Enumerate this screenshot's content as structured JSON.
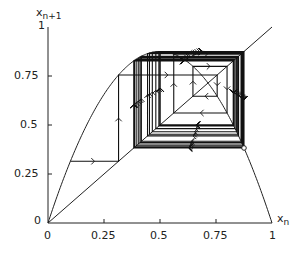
{
  "chart_data": {
    "type": "line",
    "title": "",
    "xlabel": "x_n",
    "ylabel": "x_{n+1}",
    "xlim": [
      0,
      1
    ],
    "ylim": [
      0,
      1
    ],
    "grid": false,
    "x_ticks": [
      "0",
      "0.25",
      "0.5",
      "0.75",
      "1"
    ],
    "y_ticks": [
      "0",
      "0.25",
      "0.5",
      "0.75",
      "1"
    ],
    "series": [
      {
        "name": "map curve",
        "function": "r*x*(1-x)",
        "r": 3.5
      },
      {
        "name": "diagonal",
        "function": "x",
        "points": [
          [
            0,
            0
          ],
          [
            1,
            1
          ]
        ]
      },
      {
        "name": "cobweb trajectory",
        "x0": 0.1,
        "iterations": 60,
        "arrows": true
      }
    ],
    "annotations": [
      {
        "type": "open-circle",
        "x": 0.875,
        "y": 0.875
      }
    ]
  },
  "axis": {
    "ylabel_main": "x",
    "ylabel_sub": "n+1",
    "xlabel_main": "x",
    "xlabel_sub": "n",
    "x_tick_labels": [
      "0",
      "0.25",
      "0.5",
      "0.75",
      "1"
    ],
    "y_tick_labels": [
      "0",
      "0.25",
      "0.5",
      "0.75",
      "1"
    ]
  }
}
